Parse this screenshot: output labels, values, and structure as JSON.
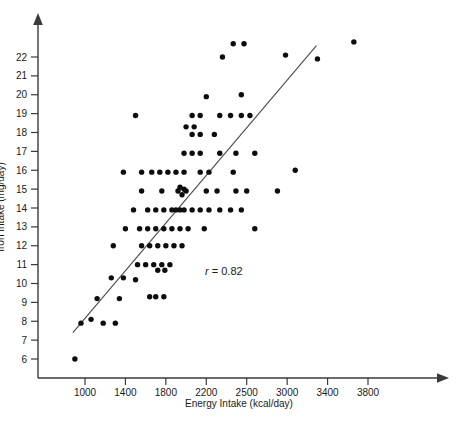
{
  "chart_data": {
    "type": "scatter",
    "title": "",
    "xlabel": "Energy Intake (kcal/day)",
    "ylabel": "Iron Intake (mg/day)",
    "xticks": [
      1000,
      1400,
      1800,
      2200,
      2500,
      3000,
      3400,
      3800
    ],
    "yticks": [
      6,
      7,
      8,
      9,
      10,
      11,
      12,
      13,
      14,
      15,
      16,
      17,
      18,
      19,
      20,
      21,
      22
    ],
    "xlim": [
      700,
      4000
    ],
    "ylim": [
      5.4,
      23.4
    ],
    "grid": false,
    "legend": false,
    "annotations": [
      {
        "name": "correlation",
        "symbol": "r",
        "relation": " = ",
        "value": "0.82"
      }
    ],
    "trendline": {
      "type": "linear-fit",
      "x_start": 880,
      "y_start": 7.4,
      "x_end": 3290,
      "y_end": 22.6
    },
    "points": [
      [
        900,
        6.0
      ],
      [
        960,
        7.9
      ],
      [
        1060,
        8.1
      ],
      [
        1180,
        7.9
      ],
      [
        1300,
        7.9
      ],
      [
        1120,
        9.2
      ],
      [
        1260,
        10.3
      ],
      [
        1380,
        10.3
      ],
      [
        1500,
        10.2
      ],
      [
        1340,
        9.2
      ],
      [
        1640,
        9.3
      ],
      [
        1700,
        9.3
      ],
      [
        1780,
        9.3
      ],
      [
        1520,
        11.0
      ],
      [
        1600,
        11.0
      ],
      [
        1680,
        11.0
      ],
      [
        1760,
        11.0
      ],
      [
        1840,
        11.0
      ],
      [
        1720,
        10.7
      ],
      [
        1790,
        10.7
      ],
      [
        1280,
        12.0
      ],
      [
        1560,
        12.0
      ],
      [
        1640,
        12.0
      ],
      [
        1720,
        12.0
      ],
      [
        1800,
        12.0
      ],
      [
        1880,
        12.0
      ],
      [
        1960,
        12.0
      ],
      [
        1400,
        12.9
      ],
      [
        1540,
        12.9
      ],
      [
        1620,
        12.9
      ],
      [
        1700,
        12.9
      ],
      [
        1780,
        12.9
      ],
      [
        1860,
        12.9
      ],
      [
        1940,
        12.9
      ],
      [
        2020,
        12.9
      ],
      [
        2180,
        12.9
      ],
      [
        2600,
        12.9
      ],
      [
        1480,
        13.9
      ],
      [
        1620,
        13.9
      ],
      [
        1700,
        13.9
      ],
      [
        1780,
        13.9
      ],
      [
        1860,
        13.9
      ],
      [
        1900,
        13.9
      ],
      [
        1940,
        13.9
      ],
      [
        1980,
        13.9
      ],
      [
        2060,
        13.9
      ],
      [
        2140,
        13.9
      ],
      [
        2220,
        13.9
      ],
      [
        2300,
        13.9
      ],
      [
        2380,
        13.9
      ],
      [
        2460,
        13.9
      ],
      [
        1560,
        14.9
      ],
      [
        1760,
        14.9
      ],
      [
        1920,
        14.9
      ],
      [
        1940,
        15.1
      ],
      [
        1960,
        14.7
      ],
      [
        1980,
        15.0
      ],
      [
        2000,
        14.9
      ],
      [
        2200,
        14.9
      ],
      [
        2280,
        14.9
      ],
      [
        2420,
        14.9
      ],
      [
        2500,
        14.9
      ],
      [
        2880,
        14.9
      ],
      [
        1380,
        15.9
      ],
      [
        1560,
        15.9
      ],
      [
        1660,
        15.9
      ],
      [
        1740,
        15.9
      ],
      [
        1820,
        15.9
      ],
      [
        1900,
        15.9
      ],
      [
        1980,
        15.9
      ],
      [
        2140,
        15.9
      ],
      [
        2220,
        15.9
      ],
      [
        2400,
        15.9
      ],
      [
        1980,
        16.9
      ],
      [
        2060,
        16.9
      ],
      [
        2140,
        16.9
      ],
      [
        2300,
        16.9
      ],
      [
        2420,
        16.9
      ],
      [
        2600,
        16.9
      ],
      [
        3080,
        16.0
      ],
      [
        2060,
        17.9
      ],
      [
        2140,
        17.9
      ],
      [
        2260,
        17.9
      ],
      [
        2000,
        18.3
      ],
      [
        2080,
        18.3
      ],
      [
        1500,
        18.9
      ],
      [
        2060,
        18.9
      ],
      [
        2140,
        18.9
      ],
      [
        2300,
        18.9
      ],
      [
        2380,
        18.9
      ],
      [
        2460,
        18.9
      ],
      [
        2540,
        18.9
      ],
      [
        2200,
        19.9
      ],
      [
        2460,
        20.0
      ],
      [
        2320,
        22.0
      ],
      [
        2400,
        22.7
      ],
      [
        2480,
        22.7
      ],
      [
        2980,
        22.1
      ],
      [
        3300,
        21.9
      ],
      [
        3660,
        22.8
      ]
    ]
  },
  "axes": {
    "x_axis_name": "x-axis",
    "y_axis_name": "y-axis"
  }
}
